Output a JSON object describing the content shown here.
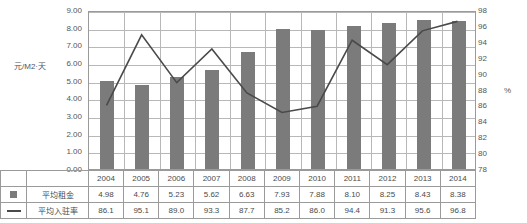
{
  "axes": {
    "y_left_title": "元/M2·天",
    "y_left_ticks": [
      "9.00",
      "8.00",
      "7.00",
      "6.00",
      "5.00",
      "4.00",
      "3.00",
      "2.00",
      "1.00",
      "0.00"
    ],
    "y_right_ticks": [
      "98",
      "96",
      "94",
      "92",
      "90",
      "88",
      "86",
      "84",
      "82",
      "80",
      "78"
    ],
    "y_right_unit": "%"
  },
  "legend": {
    "bar_label": "平均租金",
    "line_label": "平均入驻率",
    "bar_swatch": "bar-swatch-icon",
    "line_swatch": "line-swatch-icon"
  },
  "colors": {
    "bar": "#7b7b7b",
    "line": "#4a4a4a",
    "grid": "#b8b8b8",
    "frame": "#9a9a9a"
  },
  "chart_data": {
    "type": "bar",
    "title": "",
    "xlabel": "",
    "ylabel": "元/M2·天",
    "categories": [
      "2004",
      "2005",
      "2006",
      "2007",
      "2008",
      "2009",
      "2010",
      "2011",
      "2012",
      "2013",
      "2014"
    ],
    "ylim": [
      0,
      9
    ],
    "y2lim": [
      78,
      98
    ],
    "grid": true,
    "legend": "bottom-table",
    "series": [
      {
        "name": "平均租金",
        "type": "bar",
        "axis": "left",
        "values": [
          4.98,
          4.76,
          5.23,
          5.62,
          6.63,
          7.93,
          7.88,
          8.1,
          8.25,
          8.43,
          8.38
        ],
        "labels": [
          "4.98",
          "4.76",
          "5.23",
          "5.62",
          "6.63",
          "7.93",
          "7.88",
          "8.10",
          "8.25",
          "8.43",
          "8.38"
        ]
      },
      {
        "name": "平均入驻率",
        "type": "line",
        "axis": "right",
        "values": [
          86.1,
          95.1,
          89.0,
          93.3,
          87.7,
          85.2,
          86.0,
          94.4,
          91.3,
          95.6,
          96.8
        ],
        "labels": [
          "86.1",
          "95.1",
          "89.0",
          "93.3",
          "87.7",
          "85.2",
          "86.0",
          "94.4",
          "91.3",
          "95.6",
          "96.8"
        ]
      }
    ]
  }
}
